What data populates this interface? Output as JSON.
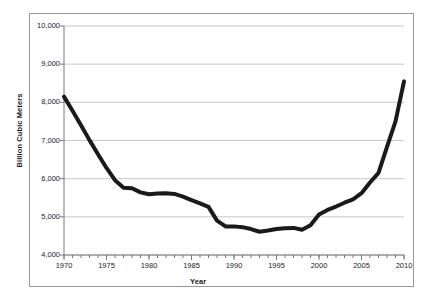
{
  "chart_data": {
    "type": "line",
    "title": "",
    "subtitle": "",
    "xlabel": "Year",
    "ylabel": "Billion Cubic Meters",
    "xlim": [
      1970,
      2010
    ],
    "ylim": [
      4000,
      10000
    ],
    "grid": true,
    "grid_axis": "y",
    "legend": false,
    "legend_position": "none",
    "line_color": "#1a1a1a",
    "line_width": 4,
    "x_tick_labels": [
      "1970",
      "1975",
      "1980",
      "1985",
      "1990",
      "1995",
      "2000",
      "2005",
      "2010"
    ],
    "x_tick_values": [
      1970,
      1975,
      1980,
      1985,
      1990,
      1995,
      2000,
      2005,
      2010
    ],
    "x_minor_tick_interval": 1,
    "y_tick_labels": [
      "4,000",
      "5,000",
      "6,000",
      "7,000",
      "8,000",
      "9,000",
      "10,000"
    ],
    "y_tick_values": [
      4000,
      5000,
      6000,
      7000,
      8000,
      9000,
      10000
    ],
    "x": [
      1970,
      1971,
      1972,
      1973,
      1974,
      1975,
      1976,
      1977,
      1978,
      1979,
      1980,
      1981,
      1982,
      1983,
      1984,
      1985,
      1986,
      1987,
      1988,
      1989,
      1990,
      1991,
      1992,
      1993,
      1994,
      1995,
      1996,
      1997,
      1998,
      1999,
      2000,
      2001,
      2002,
      2003,
      2004,
      2005,
      2006,
      2007,
      2008,
      2009,
      2010
    ],
    "values": [
      8150,
      7780,
      7400,
      7010,
      6640,
      6280,
      5960,
      5760,
      5750,
      5640,
      5590,
      5610,
      5620,
      5600,
      5530,
      5440,
      5350,
      5260,
      4900,
      4750,
      4750,
      4730,
      4680,
      4610,
      4640,
      4680,
      4700,
      4710,
      4660,
      4780,
      5060,
      5180,
      5270,
      5370,
      5460,
      5620,
      5900,
      6150,
      6830,
      7500,
      8550
    ],
    "series": [
      {
        "name": "Billion Cubic Meters",
        "values": [
          8150,
          7780,
          7400,
          7010,
          6640,
          6280,
          5960,
          5760,
          5750,
          5640,
          5590,
          5610,
          5620,
          5600,
          5530,
          5440,
          5350,
          5260,
          4900,
          4750,
          4750,
          4730,
          4680,
          4610,
          4640,
          4680,
          4700,
          4710,
          4660,
          4780,
          5060,
          5180,
          5270,
          5370,
          5460,
          5620,
          5900,
          6150,
          6830,
          7500,
          8550
        ],
        "color": "#1a1a1a"
      }
    ],
    "annotations": []
  },
  "colors": {
    "line": "#1a1a1a",
    "grid": "#c8c8c8",
    "axis": "#7a7a7a",
    "frame": "#9a9a9a",
    "background": "#ffffff",
    "text": "#1a1a1a"
  }
}
